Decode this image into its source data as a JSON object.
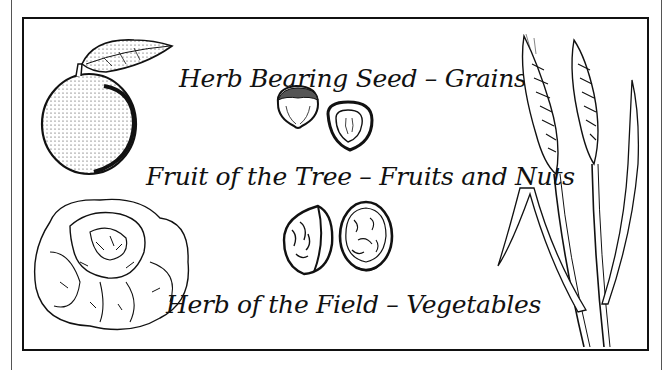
{
  "poster": {
    "captions": [
      {
        "id": "grains",
        "text": "Herb Bearing Seed – Grains"
      },
      {
        "id": "fruits-nuts",
        "text": "Fruit of the Tree – Fruits and Nuts"
      },
      {
        "id": "vegetables",
        "text": "Herb of the Field – Vegetables"
      }
    ],
    "illustrations": [
      {
        "id": "apple",
        "icon": "apple-icon"
      },
      {
        "id": "hazelnuts",
        "icon": "hazelnut-icon"
      },
      {
        "id": "walnuts",
        "icon": "walnut-icon"
      },
      {
        "id": "lettuce",
        "icon": "lettuce-icon"
      },
      {
        "id": "wheat",
        "icon": "wheat-icon"
      }
    ],
    "colors": {
      "ink": "#111111",
      "paper": "#ffffff",
      "outer_line": "#555555"
    }
  }
}
